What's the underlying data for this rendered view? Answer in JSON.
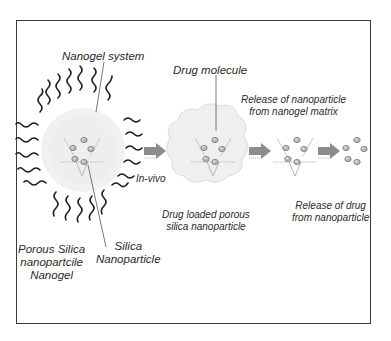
{
  "labels": {
    "nanogel_system": "Nanogel system",
    "drug_molecule": "Drug molecule",
    "release_np_line1": "Release of nanoparticle",
    "release_np_line2": "from nanogel matrix",
    "in_vivo": "In-vivo",
    "drug_loaded_line1": "Drug loaded porous",
    "drug_loaded_line2": "silica nanoparticle",
    "release_drug_line1": "Release of drug",
    "release_drug_line2": "from nanoparticle",
    "porous_line1": "Porous Silica",
    "porous_line2": "nanopartcile",
    "porous_line3": "Nanogel",
    "silica_line1": "Silica",
    "silica_line2": "Nanoparticle"
  },
  "stages": [
    {
      "name": "nanogel-with-polymer-chains"
    },
    {
      "name": "drug-loaded-porous-silica"
    },
    {
      "name": "released-nanoparticle"
    },
    {
      "name": "released-drug"
    }
  ],
  "colors": {
    "frame": "#3a3a3a",
    "arrow": "#8c8c8c",
    "chain": "#1e1e1e",
    "gel": "#e6e6e6",
    "molecule": "#9a9a9a"
  }
}
